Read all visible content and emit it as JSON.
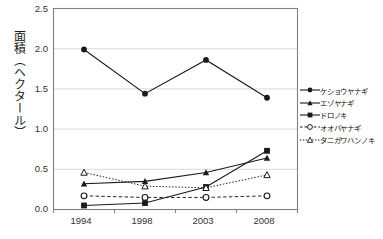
{
  "chart_data": {
    "type": "line",
    "title": "",
    "xlabel": "",
    "ylabel": "面積（ヘクタール）",
    "categories": [
      "1994",
      "1998",
      "2003",
      "2008"
    ],
    "ylim": [
      0.0,
      2.5
    ],
    "ytick_labels": [
      "0.0",
      "0.5",
      "1.0",
      "1.5",
      "2.0",
      "2.5"
    ],
    "ytick_values": [
      0.0,
      0.5,
      1.0,
      1.5,
      2.0,
      2.5
    ],
    "grid": "horizontal",
    "legend_position": "right",
    "series": [
      {
        "name": "ケショウヤナギ",
        "marker": "filled-circle",
        "line": "solid",
        "values": [
          1.99,
          1.44,
          1.86,
          1.39
        ]
      },
      {
        "name": "エゾヤナギ",
        "marker": "filled-triangle",
        "line": "solid",
        "values": [
          0.32,
          0.35,
          0.46,
          0.64
        ]
      },
      {
        "name": "ドロノキ",
        "marker": "filled-square",
        "line": "solid",
        "values": [
          0.05,
          0.08,
          0.28,
          0.73
        ]
      },
      {
        "name": "オオバヤナギ",
        "marker": "open-circle",
        "line": "dashed",
        "values": [
          0.17,
          0.15,
          0.15,
          0.17
        ]
      },
      {
        "name": "タニガワハンノキ",
        "marker": "open-triangle",
        "line": "dotted",
        "values": [
          0.46,
          0.29,
          0.27,
          0.43
        ]
      }
    ]
  },
  "colors": {
    "line": "#1a1a1a",
    "grid": "#d9d9d9",
    "axis": "#808080",
    "text": "#333333",
    "background": "#ffffff"
  },
  "axis": {
    "y_title": "面積（ヘクタール）"
  }
}
